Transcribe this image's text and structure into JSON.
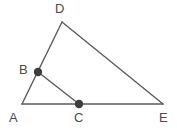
{
  "figure": {
    "type": "geometry-diagram",
    "width": 177,
    "height": 131,
    "background_color": "#ffffff",
    "stroke_color": "#5b5b5b",
    "stroke_width": 1.4,
    "dot_color": "#3d3d3d",
    "dot_radius": 4.2,
    "label_color": "#4a4a4a",
    "points": [
      {
        "id": "A",
        "label": "A",
        "x": 22,
        "y": 104,
        "marked": false,
        "label_x": 9,
        "label_y": 111
      },
      {
        "id": "B",
        "label": "B",
        "x": 38,
        "y": 72,
        "marked": true,
        "label_x": 19,
        "label_y": 63
      },
      {
        "id": "C",
        "label": "C",
        "x": 79,
        "y": 104,
        "marked": true,
        "label_x": 74,
        "label_y": 111
      },
      {
        "id": "D",
        "label": "D",
        "x": 62,
        "y": 22,
        "marked": false,
        "label_x": 55,
        "label_y": 2
      },
      {
        "id": "E",
        "label": "E",
        "x": 163,
        "y": 104,
        "marked": false,
        "label_x": 159,
        "label_y": 111
      }
    ],
    "segments": [
      {
        "id": "AD",
        "from": "A",
        "to": "D",
        "name": "segment-a-d"
      },
      {
        "id": "AE",
        "from": "A",
        "to": "E",
        "name": "segment-a-e"
      },
      {
        "id": "DE",
        "from": "D",
        "to": "E",
        "name": "segment-d-e"
      },
      {
        "id": "BC",
        "from": "B",
        "to": "C",
        "name": "segment-b-c"
      }
    ]
  }
}
